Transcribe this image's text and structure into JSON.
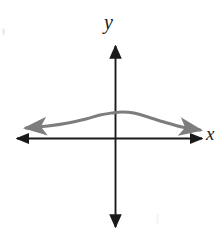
{
  "figure": {
    "background_color": "#ffffff",
    "width": 224,
    "height": 235
  },
  "axes": {
    "color": "#1a1a1a",
    "stroke_width": 2,
    "x_axis": {
      "label": "x",
      "label_name": "x-axis-label",
      "y_pixel": 138,
      "x_start_pixel": 16,
      "x_end_pixel": 203,
      "arrow_left": true,
      "arrow_right": true
    },
    "y_axis": {
      "label": "y",
      "label_name": "y-axis-label",
      "x_pixel": 115,
      "y_start_pixel": 44,
      "y_end_pixel": 229,
      "arrow_up": true,
      "arrow_down": true
    },
    "origin": {
      "x_pixel": 115,
      "y_pixel": 138
    }
  },
  "chart_data": {
    "type": "line",
    "title": "",
    "subtitle": "",
    "xlabel": "x",
    "ylabel": "y",
    "grid": false,
    "legend": null,
    "axis_ticks": [],
    "tick_labels": [],
    "annotations": [],
    "series": [
      {
        "name": "curve",
        "color": "#7d7d7d",
        "stroke_width": 3,
        "description": "Smooth bell-shaped curve, even-degree polynomial, opening downward with flat tails, both ends arrowed",
        "arrow_start": true,
        "arrow_end": true,
        "peak_pixel": {
          "x": 122,
          "y": 112
        },
        "points_pixel": [
          {
            "x": 26,
            "y": 128
          },
          {
            "x": 48,
            "y": 126
          },
          {
            "x": 68,
            "y": 123
          },
          {
            "x": 86,
            "y": 119
          },
          {
            "x": 100,
            "y": 115
          },
          {
            "x": 112,
            "y": 113
          },
          {
            "x": 122,
            "y": 112
          },
          {
            "x": 134,
            "y": 113
          },
          {
            "x": 148,
            "y": 117
          },
          {
            "x": 164,
            "y": 122
          },
          {
            "x": 182,
            "y": 127
          },
          {
            "x": 200,
            "y": 130
          }
        ]
      }
    ]
  },
  "artifacts": {
    "speck_left_name": "scan-speck-left",
    "speck_bottom_right_name": "scan-speck-bottom-right"
  }
}
